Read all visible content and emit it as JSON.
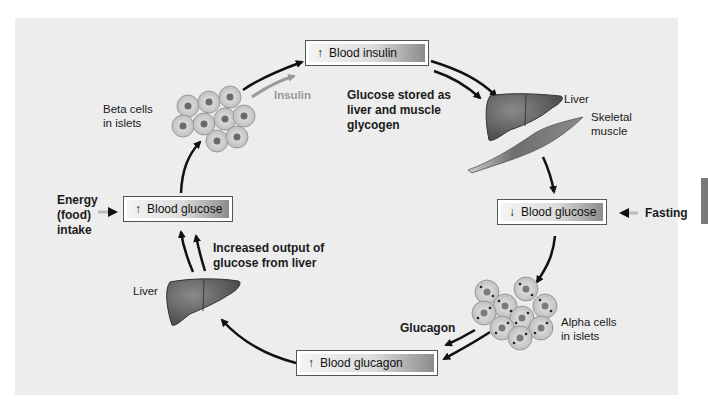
{
  "diagram": {
    "boxes": {
      "blood_insulin": {
        "arrow": "↑",
        "label": "Blood insulin"
      },
      "blood_glucose_high": {
        "arrow": "↑",
        "label": "Blood glucose"
      },
      "blood_glucose_low": {
        "arrow": "↓",
        "label": "Blood glucose"
      },
      "blood_glucagon": {
        "arrow": "↑",
        "label": "Blood glucagon"
      }
    },
    "labels": {
      "beta_cells": [
        "Beta cells",
        "in islets"
      ],
      "insulin": "Insulin",
      "glucose_stored": [
        "Glucose stored as",
        "liver and muscle",
        "glycogen"
      ],
      "liver_top": "Liver",
      "skeletal_muscle": [
        "Skeletal",
        "muscle"
      ],
      "fasting": "Fasting",
      "alpha_cells": [
        "Alpha cells",
        "in islets"
      ],
      "glucagon": "Glucagon",
      "liver_bottom": "Liver",
      "increased_output": [
        "Increased output of",
        "glucose from liver"
      ],
      "energy_intake": [
        "Energy",
        "(food)",
        "intake"
      ]
    },
    "icons": [
      "beta-cell-cluster-icon",
      "alpha-cell-cluster-icon",
      "liver-icon",
      "skeletal-muscle-icon"
    ],
    "colors": {
      "panel_bg": "#ededed",
      "organ": "#5f5f5f",
      "arrow": "#111111",
      "insulin_arrow": "#9a9a9a"
    }
  }
}
